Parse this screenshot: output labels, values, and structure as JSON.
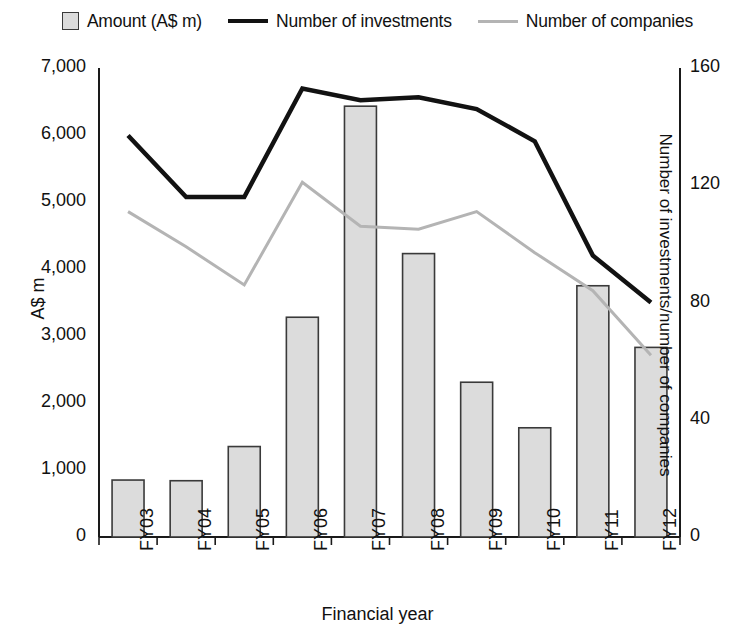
{
  "legend": {
    "items": [
      {
        "label": "Amount (A$ m)",
        "marker": "filled-square-swatch",
        "color": "#dcdcdc"
      },
      {
        "label": "Number of investments",
        "marker": "line-swatch",
        "color": "#121212"
      },
      {
        "label": "Number of companies",
        "marker": "line-swatch",
        "color": "#b4b4b4"
      }
    ]
  },
  "axes": {
    "left": {
      "title": "A$ m",
      "ticks": [
        "0",
        "1,000",
        "2,000",
        "3,000",
        "4,000",
        "5,000",
        "6,000",
        "7,000"
      ],
      "tick_values": [
        0,
        1000,
        2000,
        3000,
        4000,
        5000,
        6000,
        7000
      ],
      "min": 0,
      "max": 7000
    },
    "right": {
      "title": "Number of investments/number of companies",
      "ticks": [
        "0",
        "40",
        "80",
        "120",
        "160"
      ],
      "tick_values": [
        0,
        40,
        80,
        120,
        160
      ],
      "min": 0,
      "max": 160
    },
    "bottom": {
      "title": "Financial year",
      "ticks": [
        "FY03",
        "FY04",
        "FY05",
        "FY06",
        "FY07",
        "FY08",
        "FY09",
        "FY10",
        "FY11",
        "FY12"
      ]
    }
  },
  "chart_data": {
    "type": "bar",
    "title": "",
    "subtitle": "",
    "xlabel": "Financial year",
    "ylabel": "A$ m",
    "y2label": "Number of investments/number of companies",
    "categories": [
      "FY03",
      "FY04",
      "FY05",
      "FY06",
      "FY07",
      "FY08",
      "FY09",
      "FY10",
      "FY11",
      "FY12"
    ],
    "ylim": [
      0,
      7000
    ],
    "y2lim": [
      0,
      160
    ],
    "grid": false,
    "legend_position": "top",
    "series": [
      {
        "name": "Amount (A$ m)",
        "type": "bar",
        "axis": "left",
        "color": "#dcdcdc",
        "edge_color": "#3a3a3a",
        "values": [
          850,
          840,
          1350,
          3280,
          6430,
          4230,
          2310,
          1630,
          3750,
          2830
        ]
      },
      {
        "name": "Number of investments",
        "type": "line",
        "axis": "right",
        "color": "#121212",
        "width": 4.5,
        "values": [
          137,
          116,
          116,
          153,
          149,
          150,
          146,
          135,
          96,
          80
        ]
      },
      {
        "name": "Number of companies",
        "type": "line",
        "axis": "right",
        "color": "#b4b4b4",
        "width": 3,
        "values": [
          111,
          99,
          86,
          121,
          106,
          105,
          111,
          97,
          84,
          62
        ]
      }
    ]
  }
}
